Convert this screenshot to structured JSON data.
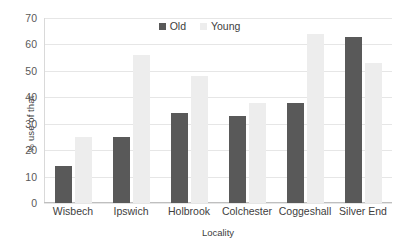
{
  "chart_data": {
    "type": "bar",
    "title": "",
    "xlabel": "Locality",
    "ylabel": "% use of that",
    "categories": [
      "Wisbech",
      "Ipswich",
      "Holbrook",
      "Colchester",
      "Coggeshall",
      "Silver End"
    ],
    "series": [
      {
        "name": "Old",
        "color": "#595959",
        "values": [
          14,
          25,
          34,
          33,
          38,
          63
        ]
      },
      {
        "name": "Young",
        "color": "#ededed",
        "values": [
          25,
          56,
          48,
          38,
          64,
          53
        ]
      }
    ],
    "ylim": [
      0,
      70
    ],
    "ytick_step": 10,
    "yticks": [
      "70",
      "60",
      "50",
      "40",
      "30",
      "20",
      "10",
      "0"
    ],
    "ytick_values": [
      70,
      60,
      50,
      40,
      30,
      20,
      10,
      0
    ],
    "grid": true,
    "grid_axis": "y",
    "legend_position": "top-center"
  },
  "legend": {
    "items": [
      {
        "label": "Old",
        "swatch": "old"
      },
      {
        "label": "Young",
        "swatch": "young"
      }
    ]
  },
  "axes": {
    "y_title": "% use of that",
    "x_title": "Locality"
  },
  "colors": {
    "old": "#595959",
    "young": "#ededed",
    "grid": "#e6e6e6",
    "axis": "#bfbfbf",
    "text": "#404040",
    "background": "#ffffff"
  }
}
